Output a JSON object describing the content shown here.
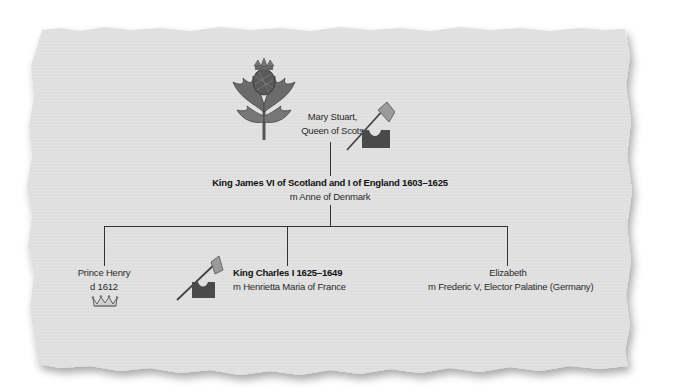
{
  "diagram": {
    "type": "family-tree",
    "colors": {
      "paper": "#e4e4e4",
      "paper_shadow": "#bdbdbd",
      "line": "#333333",
      "thistle_leaf": "#6b6b6b",
      "axe_block": "#4a4a4a",
      "axe_blade": "#9a9a9a"
    },
    "nodes": {
      "mary": {
        "line1": "Mary Stuart,",
        "line2": "Queen of Scots",
        "icons": [
          "thistle-icon",
          "executioner-axe-icon"
        ]
      },
      "james": {
        "name": "King James VI of Scotland and I of England 1603–1625",
        "spouse": "m Anne of Denmark"
      },
      "henry": {
        "line1": "Prince Henry",
        "line2": "d 1612",
        "icons": [
          "crown-icon"
        ]
      },
      "charles": {
        "name": "King Charles I 1625–1649",
        "spouse": "m Henrietta Maria of France",
        "icons": [
          "executioner-axe-icon"
        ]
      },
      "elizabeth": {
        "line1": "Elizabeth",
        "line2": "m Frederic V, Elector Palatine (Germany)"
      }
    }
  }
}
